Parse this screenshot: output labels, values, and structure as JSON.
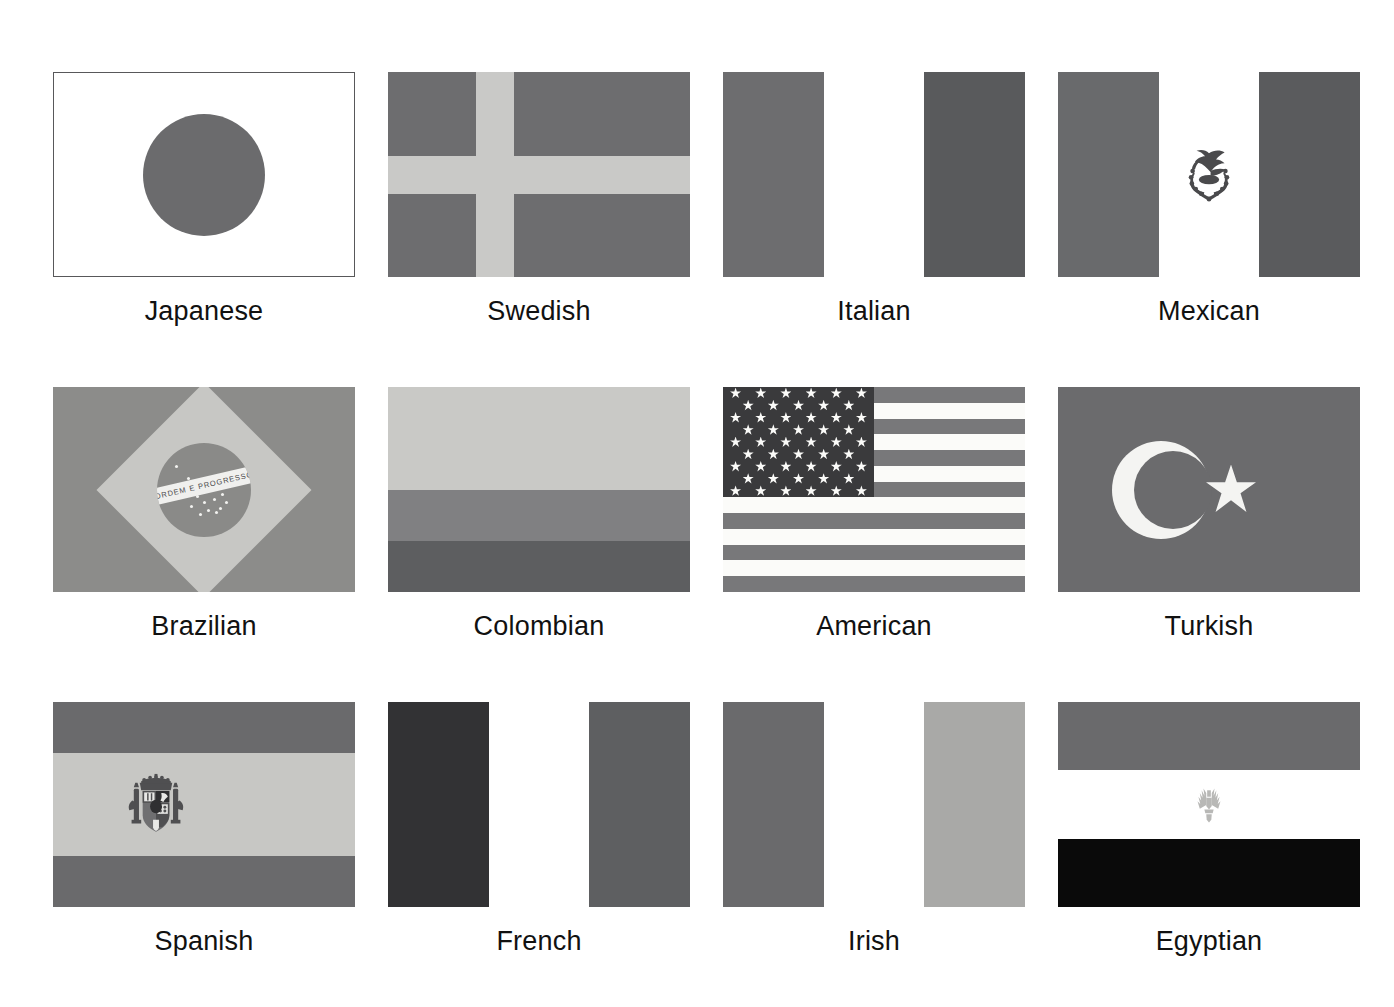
{
  "page": {
    "background": "#ffffff",
    "grid": {
      "columns": 4,
      "rows": 3
    }
  },
  "palette": {
    "japanese_disc": "#6b6b6d",
    "swedish_field": "#6d6d6f",
    "swedish_cross": "#c9c9c7",
    "italian_green": "#6d6d6f",
    "italian_white": "#ffffff",
    "italian_red": "#595a5c",
    "mexican_green": "#696a6c",
    "mexican_white": "#ffffff",
    "mexican_red": "#5a5b5d",
    "mexican_emblem": "#4a4a4c",
    "brazilian_green": "#8c8c8a",
    "brazilian_yellow": "#c7c7c4",
    "brazilian_blue": "#8a8a88",
    "brazilian_band": "#f0f0ee",
    "colombian_yellow": "#c9c9c6",
    "colombian_blue": "#808082",
    "colombian_red": "#5d5e60",
    "american_canton": "#3a3a3c",
    "american_stripe_red": "#78787a",
    "american_stripe_white": "#fbfbf9",
    "turkish_red": "#6b6b6d",
    "turkish_white": "#f4f4f2",
    "spanish_red": "#6a6a6c",
    "spanish_yellow": "#c7c7c4",
    "spanish_emblem": "#4f4f51",
    "french_blue": "#323234",
    "french_white": "#ffffff",
    "french_red": "#5e5f61",
    "irish_green": "#6a6a6c",
    "irish_white": "#ffffff",
    "irish_orange": "#a9a9a7",
    "egyptian_red": "#6a6a6c",
    "egyptian_white": "#ffffff",
    "egyptian_black": "#0a0a0a",
    "egyptian_emblem": "#b8b8b6",
    "frame_border": "#58585a"
  },
  "flags": [
    {
      "id": "japanese",
      "label": "Japanese",
      "kind": "disc",
      "field": "#ffffff",
      "bordered": true,
      "emblem_name": "red-sun-disc"
    },
    {
      "id": "swedish",
      "label": "Swedish",
      "kind": "nordic-cross",
      "field": "#6d6d6f",
      "cross": "#c9c9c7",
      "bordered": false
    },
    {
      "id": "italian",
      "label": "Italian",
      "kind": "vertical-tricolor",
      "bands": [
        "#6d6d6f",
        "#ffffff",
        "#595a5c"
      ],
      "bordered": false
    },
    {
      "id": "mexican",
      "label": "Mexican",
      "kind": "vertical-tricolor",
      "bands": [
        "#696a6c",
        "#ffffff",
        "#5a5b5d"
      ],
      "bordered": false,
      "emblem_name": "mexican-coat-of-arms-eagle"
    },
    {
      "id": "brazilian",
      "label": "Brazilian",
      "kind": "diamond-globe",
      "field": "#8c8c8a",
      "diamond": "#c7c7c4",
      "globe": "#8a8a88",
      "bordered": false,
      "motto": "ORDEM E PROGRESSO"
    },
    {
      "id": "colombian",
      "label": "Colombian",
      "kind": "horizontal-bands",
      "bands": [
        "#c9c9c6",
        "#808082",
        "#5d5e60"
      ],
      "band_weights": [
        2,
        1,
        1
      ],
      "bordered": false
    },
    {
      "id": "american",
      "label": "American",
      "kind": "stars-and-stripes",
      "stripe_count": 13,
      "star_count": 50,
      "canton": "#3a3a3c",
      "stripe_red": "#78787a",
      "stripe_white": "#fbfbf9",
      "bordered": false
    },
    {
      "id": "turkish",
      "label": "Turkish",
      "kind": "crescent-star",
      "field": "#6b6b6d",
      "symbol": "#f4f4f2",
      "bordered": false
    },
    {
      "id": "spanish",
      "label": "Spanish",
      "kind": "horizontal-bands",
      "bands": [
        "#6a6a6c",
        "#c7c7c4",
        "#6a6a6c"
      ],
      "band_weights": [
        1,
        2,
        1
      ],
      "bordered": false,
      "emblem_name": "spanish-coat-of-arms"
    },
    {
      "id": "french",
      "label": "French",
      "kind": "vertical-tricolor",
      "bands": [
        "#323234",
        "#ffffff",
        "#5e5f61"
      ],
      "bordered": false
    },
    {
      "id": "irish",
      "label": "Irish",
      "kind": "vertical-tricolor",
      "bands": [
        "#6a6a6c",
        "#ffffff",
        "#a9a9a7"
      ],
      "bordered": false
    },
    {
      "id": "egyptian",
      "label": "Egyptian",
      "kind": "horizontal-bands",
      "bands": [
        "#6a6a6c",
        "#ffffff",
        "#0a0a0a"
      ],
      "band_weights": [
        1,
        1,
        1
      ],
      "bordered": false,
      "emblem_name": "eagle-of-saladin"
    }
  ]
}
